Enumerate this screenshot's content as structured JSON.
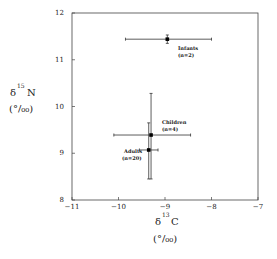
{
  "chart_data": {
    "type": "scatter",
    "title": "",
    "xlabel": "δ13C (‰)",
    "ylabel": "δ15N (‰)",
    "xlim": [
      -11,
      -7
    ],
    "ylim": [
      8,
      12
    ],
    "xticks": [
      "-11",
      "-10",
      "-9",
      "-8",
      "-7"
    ],
    "yticks": [
      "8",
      "9",
      "10",
      "11",
      "12"
    ],
    "grid": false,
    "legend": "none",
    "series": [
      {
        "name": "Infants",
        "n_label": "(n=2)",
        "x": -8.95,
        "y": 11.44,
        "x_err": [
          -9.85,
          -8.0
        ],
        "y_err": [
          11.35,
          11.53
        ]
      },
      {
        "name": "Children",
        "n_label": "(n=4)",
        "x": -9.3,
        "y": 9.39,
        "x_err": [
          -10.1,
          -8.45
        ],
        "y_err": [
          8.45,
          10.28
        ]
      },
      {
        "name": "Adults",
        "n_label": "(n=20)",
        "x": -9.35,
        "y": 9.07,
        "x_err": [
          -9.55,
          -9.15
        ],
        "y_err": [
          8.45,
          9.65
        ]
      }
    ]
  },
  "axes": {
    "x_label_main": "δ",
    "x_label_sup": "13",
    "x_label_elem": "C",
    "x_unit": "(°/₀₀)",
    "y_label_main": "δ",
    "y_label_sup": "15",
    "y_label_elem": "N",
    "y_unit": "(°/₀₀)"
  }
}
